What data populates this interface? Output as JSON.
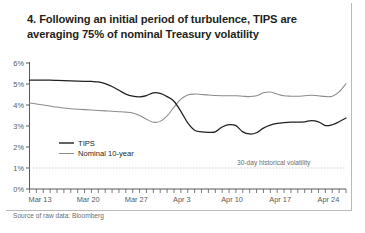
{
  "card": {
    "title": "4. Following an initial period of turbulence, TIPS are averaging 75% of nominal Treasury volatility",
    "source": "Source of raw data: Bloomberg"
  },
  "colors": {
    "tips_line": "#231f20",
    "nominal_line": "#8c8c8c",
    "axis": "#58595b",
    "dotted": "#c8c8c8",
    "text": "#231f20",
    "muted_text": "#6d6e71",
    "frame": "#b9b9b9"
  },
  "chart_data": {
    "type": "line",
    "title": "4. Following an initial period of turbulence, TIPS are averaging 75% of nominal Treasury volatility",
    "xlabel": "",
    "ylabel": "",
    "ylim": [
      0,
      6
    ],
    "yticks": [
      0,
      1,
      2,
      3,
      4,
      5,
      6
    ],
    "yticklabels": [
      "0%",
      "1%",
      "2%",
      "3%",
      "4%",
      "5%",
      "6%"
    ],
    "grid": false,
    "legend_position": "inside-lower-left",
    "xticklabels": [
      "Mar 13",
      "Mar 20",
      "Mar 27",
      "Apr 3",
      "Apr 10",
      "Apr 17",
      "Apr 24"
    ],
    "xtick_positions": [
      0,
      7,
      14,
      21,
      28,
      35,
      42
    ],
    "x_minor_tick_count": 47,
    "annotations": [
      {
        "text": "30-day historical volatility",
        "x": 35.5,
        "y": 1.0
      }
    ],
    "reference_lines": [
      {
        "name": "one-percent-dotted",
        "y": 1.0,
        "style": "dotted",
        "color": "#c8c8c8"
      }
    ],
    "x": [
      0,
      1,
      2,
      3,
      4,
      5,
      6,
      7,
      8,
      9,
      10,
      11,
      12,
      13,
      14,
      15,
      16,
      17,
      18,
      19,
      20,
      21,
      22,
      23,
      24,
      25,
      26,
      27,
      28,
      29,
      30,
      31,
      32,
      33,
      34,
      35,
      36,
      37,
      38,
      39,
      40,
      41,
      42,
      43,
      44,
      45,
      46
    ],
    "series": [
      {
        "name": "TIPS",
        "color": "#231f20",
        "values": [
          5.18,
          5.18,
          5.18,
          5.18,
          5.17,
          5.16,
          5.15,
          5.14,
          5.13,
          5.12,
          5.1,
          5.02,
          4.88,
          4.7,
          4.52,
          4.42,
          4.39,
          4.45,
          4.58,
          4.55,
          4.4,
          4.18,
          3.7,
          3.15,
          2.8,
          2.72,
          2.7,
          2.72,
          2.95,
          3.06,
          3.02,
          2.72,
          2.62,
          2.68,
          2.9,
          3.04,
          3.12,
          3.16,
          3.18,
          3.18,
          3.2,
          3.26,
          3.2,
          3.02,
          3.06,
          3.2,
          3.38
        ]
      },
      {
        "name": "Nominal 10-year",
        "color": "#8c8c8c",
        "values": [
          4.1,
          4.05,
          4.0,
          3.95,
          3.9,
          3.86,
          3.82,
          3.8,
          3.78,
          3.76,
          3.74,
          3.72,
          3.7,
          3.68,
          3.66,
          3.62,
          3.5,
          3.32,
          3.18,
          3.22,
          3.48,
          3.9,
          4.28,
          4.48,
          4.52,
          4.5,
          4.48,
          4.45,
          4.44,
          4.44,
          4.44,
          4.42,
          4.4,
          4.44,
          4.58,
          4.62,
          4.52,
          4.44,
          4.42,
          4.42,
          4.44,
          4.46,
          4.44,
          4.4,
          4.42,
          4.62,
          5.02
        ]
      }
    ],
    "legend": [
      {
        "label": "TIPS",
        "color": "#231f20"
      },
      {
        "label": "Nominal 10-year",
        "color": "#8c8c8c"
      }
    ]
  }
}
